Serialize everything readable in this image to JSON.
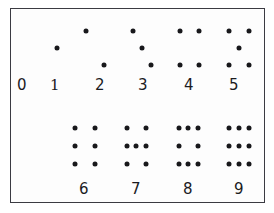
{
  "chart_data": {
    "type": "table",
    "xlabel": "",
    "ylabel": "",
    "categories": [
      "0",
      "1",
      "2",
      "3",
      "4",
      "5",
      "6",
      "7",
      "8",
      "9"
    ],
    "values": [
      0,
      1,
      2,
      3,
      4,
      5,
      6,
      7,
      8,
      9
    ],
    "legend": [],
    "grid": false,
    "groups": [
      {
        "label": "0",
        "count": 0,
        "row": "top",
        "label_x": 22,
        "label_y": 76,
        "dots": []
      },
      {
        "label": "1",
        "count": 1,
        "row": "top",
        "label_x": 55,
        "label_y": 76,
        "dots": [
          {
            "x": 57,
            "y": 48
          }
        ]
      },
      {
        "label": "2",
        "count": 2,
        "row": "top",
        "label_x": 100,
        "label_y": 76,
        "dots": [
          {
            "x": 86,
            "y": 31
          },
          {
            "x": 104,
            "y": 65
          }
        ]
      },
      {
        "label": "3",
        "count": 3,
        "row": "top",
        "label_x": 143,
        "label_y": 76,
        "dots": [
          {
            "x": 133,
            "y": 31
          },
          {
            "x": 142,
            "y": 48
          },
          {
            "x": 151,
            "y": 65
          }
        ]
      },
      {
        "label": "4",
        "count": 4,
        "row": "top",
        "label_x": 189,
        "label_y": 76,
        "dots": [
          {
            "x": 180,
            "y": 31
          },
          {
            "x": 199,
            "y": 31
          },
          {
            "x": 180,
            "y": 65
          },
          {
            "x": 199,
            "y": 65
          }
        ]
      },
      {
        "label": "5",
        "count": 5,
        "row": "top",
        "label_x": 234,
        "label_y": 76,
        "dots": [
          {
            "x": 229,
            "y": 31
          },
          {
            "x": 249,
            "y": 31
          },
          {
            "x": 239,
            "y": 48
          },
          {
            "x": 229,
            "y": 65
          },
          {
            "x": 249,
            "y": 65
          }
        ]
      },
      {
        "label": "6",
        "count": 6,
        "row": "bottom",
        "label_x": 84,
        "label_y": 180,
        "dots": [
          {
            "x": 75,
            "y": 128
          },
          {
            "x": 95,
            "y": 128
          },
          {
            "x": 75,
            "y": 146
          },
          {
            "x": 95,
            "y": 146
          },
          {
            "x": 75,
            "y": 164
          },
          {
            "x": 95,
            "y": 164
          }
        ]
      },
      {
        "label": "7",
        "count": 7,
        "row": "bottom",
        "label_x": 136,
        "label_y": 180,
        "dots": [
          {
            "x": 127,
            "y": 128
          },
          {
            "x": 146,
            "y": 128
          },
          {
            "x": 127,
            "y": 146
          },
          {
            "x": 136,
            "y": 146
          },
          {
            "x": 146,
            "y": 146
          },
          {
            "x": 127,
            "y": 164
          },
          {
            "x": 146,
            "y": 164
          }
        ]
      },
      {
        "label": "8",
        "count": 8,
        "row": "bottom",
        "label_x": 188,
        "label_y": 180,
        "dots": [
          {
            "x": 179,
            "y": 128
          },
          {
            "x": 188,
            "y": 128
          },
          {
            "x": 198,
            "y": 128
          },
          {
            "x": 179,
            "y": 146
          },
          {
            "x": 198,
            "y": 146
          },
          {
            "x": 179,
            "y": 164
          },
          {
            "x": 188,
            "y": 164
          },
          {
            "x": 198,
            "y": 164
          }
        ]
      },
      {
        "label": "9",
        "count": 9,
        "row": "bottom",
        "label_x": 239,
        "label_y": 180,
        "dots": [
          {
            "x": 229,
            "y": 128
          },
          {
            "x": 239,
            "y": 128
          },
          {
            "x": 249,
            "y": 128
          },
          {
            "x": 229,
            "y": 146
          },
          {
            "x": 239,
            "y": 146
          },
          {
            "x": 249,
            "y": 146
          },
          {
            "x": 229,
            "y": 164
          },
          {
            "x": 239,
            "y": 164
          },
          {
            "x": 249,
            "y": 164
          }
        ]
      }
    ],
    "style": {
      "dot_color": "#18181b",
      "label_color": "#1b1b1f",
      "frame_color": "#3b3b42",
      "background": "#ffffff",
      "dot_diameter_px": 5
    }
  }
}
